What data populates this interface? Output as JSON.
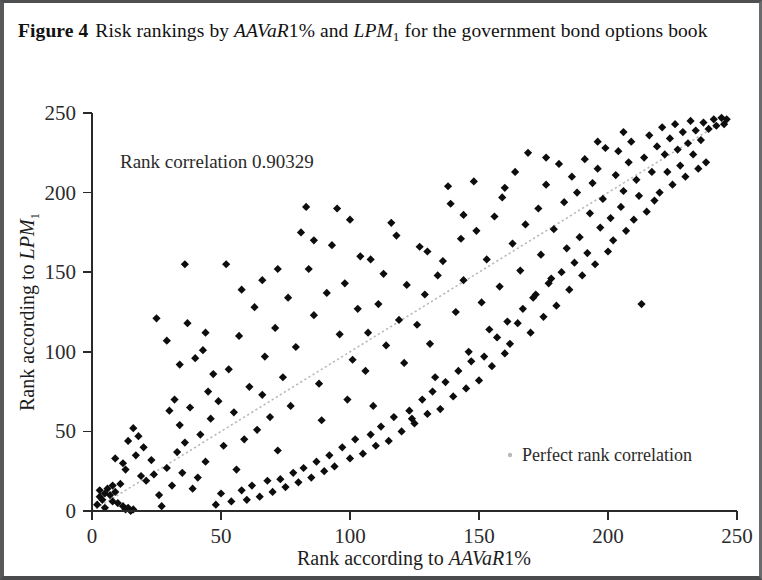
{
  "figure": {
    "label": "Figure 4",
    "caption_part1": "Risk rankings by ",
    "caption_math1": "AAVaR",
    "caption_math1_tail": "1%",
    "caption_part2": " and ",
    "caption_math2": "LPM",
    "caption_math2_sub": "1",
    "caption_part3": " for the government bond options book"
  },
  "chart_data": {
    "type": "scatter",
    "xlabel": "Rank according to AAVaR1%",
    "ylabel": "Rank according to LPM1",
    "xlabel_plain": "Rank according to ",
    "xlabel_math": "AAVaR",
    "xlabel_math_tail": "1%",
    "ylabel_plain": "Rank according to ",
    "ylabel_math": "LPM",
    "ylabel_math_sub": "1",
    "xlim": [
      0,
      250
    ],
    "ylim": [
      0,
      250
    ],
    "xticks": [
      0,
      50,
      100,
      150,
      200,
      250
    ],
    "yticks": [
      0,
      50,
      100,
      150,
      200,
      250
    ],
    "xtick_labels": [
      "0",
      "50",
      "100",
      "150",
      "200",
      "250"
    ],
    "ytick_labels": [
      "0",
      "50",
      "100",
      "150",
      "200",
      "250"
    ],
    "grid": false,
    "annotation": "Rank correlation 0.90329",
    "annotation_value": 0.90329,
    "legend": [
      {
        "label": "Perfect rank correlation",
        "marker": "dot",
        "color": "#b9b9b9"
      }
    ],
    "legend_position": "inside-lower-right",
    "marker_color": "#0d0d0d",
    "marker_shape": "diamond",
    "reference_line": {
      "name": "Perfect rank correlation",
      "style": "dotted",
      "color": "#b9b9b9",
      "from": [
        0,
        0
      ],
      "to": [
        246,
        246
      ]
    },
    "series": [
      {
        "name": "Rank pairs",
        "points": [
          [
            2,
            4
          ],
          [
            3,
            9
          ],
          [
            3,
            13
          ],
          [
            4,
            7
          ],
          [
            5,
            11
          ],
          [
            5,
            2
          ],
          [
            6,
            14
          ],
          [
            7,
            10
          ],
          [
            8,
            16
          ],
          [
            8,
            6
          ],
          [
            9,
            12
          ],
          [
            10,
            5
          ],
          [
            11,
            17
          ],
          [
            12,
            3
          ],
          [
            13,
            1
          ],
          [
            14,
            2
          ],
          [
            15,
            0
          ],
          [
            16,
            1
          ],
          [
            9,
            33
          ],
          [
            12,
            30
          ],
          [
            13,
            26
          ],
          [
            17,
            35
          ],
          [
            19,
            22
          ],
          [
            21,
            19
          ],
          [
            20,
            40
          ],
          [
            23,
            32
          ],
          [
            18,
            47
          ],
          [
            16,
            52
          ],
          [
            14,
            44
          ],
          [
            27,
            3
          ],
          [
            26,
            10
          ],
          [
            24,
            23
          ],
          [
            29,
            27
          ],
          [
            31,
            16
          ],
          [
            33,
            37
          ],
          [
            35,
            24
          ],
          [
            34,
            54
          ],
          [
            36,
            43
          ],
          [
            38,
            65
          ],
          [
            39,
            14
          ],
          [
            41,
            21
          ],
          [
            42,
            48
          ],
          [
            44,
            31
          ],
          [
            45,
            75
          ],
          [
            46,
            58
          ],
          [
            25,
            121
          ],
          [
            29,
            107
          ],
          [
            34,
            92
          ],
          [
            37,
            118
          ],
          [
            40,
            96
          ],
          [
            43,
            101
          ],
          [
            47,
            86
          ],
          [
            36,
            155
          ],
          [
            52,
            155
          ],
          [
            49,
            69
          ],
          [
            51,
            41
          ],
          [
            53,
            89
          ],
          [
            55,
            62
          ],
          [
            56,
            26
          ],
          [
            57,
            110
          ],
          [
            59,
            45
          ],
          [
            61,
            78
          ],
          [
            63,
            128
          ],
          [
            64,
            51
          ],
          [
            66,
            73
          ],
          [
            67,
            97
          ],
          [
            69,
            59
          ],
          [
            71,
            115
          ],
          [
            72,
            38
          ],
          [
            74,
            84
          ],
          [
            76,
            134
          ],
          [
            77,
            66
          ],
          [
            79,
            103
          ],
          [
            81,
            175
          ],
          [
            83,
            191
          ],
          [
            84,
            152
          ],
          [
            86,
            123
          ],
          [
            88,
            80
          ],
          [
            89,
            57
          ],
          [
            91,
            137
          ],
          [
            93,
            167
          ],
          [
            95,
            190
          ],
          [
            96,
            111
          ],
          [
            98,
            143
          ],
          [
            99,
            70
          ],
          [
            101,
            95
          ],
          [
            103,
            127
          ],
          [
            104,
            160
          ],
          [
            106,
            88
          ],
          [
            107,
            112
          ],
          [
            109,
            66
          ],
          [
            111,
            130
          ],
          [
            113,
            149
          ],
          [
            114,
            104
          ],
          [
            116,
            181
          ],
          [
            118,
            173
          ],
          [
            119,
            120
          ],
          [
            121,
            93
          ],
          [
            122,
            142
          ],
          [
            124,
            58
          ],
          [
            126,
            117
          ],
          [
            127,
            166
          ],
          [
            129,
            136
          ],
          [
            131,
            105
          ],
          [
            133,
            84
          ],
          [
            134,
            148
          ],
          [
            136,
            157
          ],
          [
            138,
            204
          ],
          [
            139,
            193
          ],
          [
            141,
            125
          ],
          [
            143,
            171
          ],
          [
            144,
            145
          ],
          [
            146,
            100
          ],
          [
            148,
            207
          ],
          [
            149,
            176
          ],
          [
            151,
            131
          ],
          [
            153,
            158
          ],
          [
            154,
            114
          ],
          [
            156,
            185
          ],
          [
            158,
            141
          ],
          [
            159,
            197
          ],
          [
            161,
            119
          ],
          [
            163,
            168
          ],
          [
            164,
            213
          ],
          [
            166,
            151
          ],
          [
            168,
            180
          ],
          [
            169,
            225
          ],
          [
            171,
            134
          ],
          [
            173,
            190
          ],
          [
            174,
            161
          ],
          [
            176,
            205
          ],
          [
            178,
            146
          ],
          [
            179,
            177
          ],
          [
            181,
            218
          ],
          [
            183,
            194
          ],
          [
            184,
            165
          ],
          [
            186,
            210
          ],
          [
            188,
            200
          ],
          [
            189,
            172
          ],
          [
            191,
            221
          ],
          [
            193,
            187
          ],
          [
            194,
            206
          ],
          [
            196,
            215
          ],
          [
            198,
            196
          ],
          [
            199,
            228
          ],
          [
            201,
            184
          ],
          [
            203,
            211
          ],
          [
            204,
            226
          ],
          [
            206,
            201
          ],
          [
            208,
            219
          ],
          [
            209,
            232
          ],
          [
            211,
            208
          ],
          [
            213,
            130
          ],
          [
            214,
            222
          ],
          [
            216,
            236
          ],
          [
            217,
            213
          ],
          [
            219,
            229
          ],
          [
            221,
            241
          ],
          [
            222,
            224
          ],
          [
            224,
            234
          ],
          [
            226,
            243
          ],
          [
            227,
            227
          ],
          [
            229,
            238
          ],
          [
            231,
            231
          ],
          [
            232,
            245
          ],
          [
            234,
            239
          ],
          [
            236,
            233
          ],
          [
            237,
            244
          ],
          [
            239,
            240
          ],
          [
            241,
            246
          ],
          [
            242,
            242
          ],
          [
            244,
            247
          ],
          [
            245,
            243
          ],
          [
            246,
            246
          ],
          [
            238,
            219
          ],
          [
            235,
            215
          ],
          [
            233,
            224
          ],
          [
            230,
            210
          ],
          [
            228,
            217
          ],
          [
            225,
            205
          ],
          [
            223,
            213
          ],
          [
            220,
            200
          ],
          [
            218,
            195
          ],
          [
            215,
            188
          ],
          [
            212,
            198
          ],
          [
            210,
            183
          ],
          [
            207,
            176
          ],
          [
            205,
            191
          ],
          [
            202,
            170
          ],
          [
            200,
            163
          ],
          [
            197,
            178
          ],
          [
            195,
            155
          ],
          [
            192,
            162
          ],
          [
            190,
            148
          ],
          [
            187,
            156
          ],
          [
            185,
            139
          ],
          [
            182,
            150
          ],
          [
            180,
            129
          ],
          [
            177,
            143
          ],
          [
            175,
            122
          ],
          [
            172,
            136
          ],
          [
            170,
            112
          ],
          [
            167,
            127
          ],
          [
            165,
            118
          ],
          [
            162,
            105
          ],
          [
            160,
            99
          ],
          [
            157,
            109
          ],
          [
            155,
            91
          ],
          [
            152,
            97
          ],
          [
            150,
            82
          ],
          [
            147,
            94
          ],
          [
            145,
            77
          ],
          [
            142,
            88
          ],
          [
            140,
            72
          ],
          [
            137,
            81
          ],
          [
            135,
            64
          ],
          [
            132,
            75
          ],
          [
            130,
            61
          ],
          [
            128,
            70
          ],
          [
            125,
            55
          ],
          [
            123,
            63
          ],
          [
            120,
            50
          ],
          [
            117,
            59
          ],
          [
            115,
            44
          ],
          [
            112,
            53
          ],
          [
            110,
            41
          ],
          [
            108,
            48
          ],
          [
            105,
            36
          ],
          [
            102,
            45
          ],
          [
            100,
            33
          ],
          [
            97,
            40
          ],
          [
            94,
            28
          ],
          [
            92,
            35
          ],
          [
            90,
            25
          ],
          [
            87,
            31
          ],
          [
            85,
            21
          ],
          [
            82,
            27
          ],
          [
            80,
            18
          ],
          [
            78,
            24
          ],
          [
            75,
            15
          ],
          [
            73,
            20
          ],
          [
            70,
            12
          ],
          [
            68,
            19
          ],
          [
            65,
            9
          ],
          [
            62,
            16
          ],
          [
            60,
            7
          ],
          [
            58,
            13
          ],
          [
            54,
            6
          ],
          [
            50,
            11
          ],
          [
            48,
            4
          ],
          [
            30,
            63
          ],
          [
            32,
            70
          ],
          [
            44,
            112
          ],
          [
            58,
            139
          ],
          [
            66,
            145
          ],
          [
            72,
            152
          ],
          [
            86,
            170
          ],
          [
            100,
            183
          ],
          [
            108,
            158
          ],
          [
            130,
            163
          ],
          [
            144,
            186
          ],
          [
            160,
            203
          ],
          [
            176,
            222
          ],
          [
            196,
            232
          ],
          [
            206,
            238
          ]
        ]
      }
    ]
  }
}
